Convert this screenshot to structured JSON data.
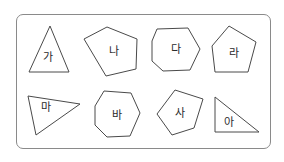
{
  "figure": {
    "frame": {
      "border_color": "#8a8a8a",
      "radius": 7
    },
    "stroke_color": "#4a4a4a",
    "label_color": "#2a2a2a",
    "shapes": [
      {
        "id": "ga",
        "label": "가",
        "type": "triangle",
        "sides": 3,
        "points": "50,26 29,72 69,72",
        "label_pos": [
          48,
          57
        ]
      },
      {
        "id": "na",
        "label": "나",
        "type": "pentagon",
        "sides": 5,
        "points": "84,39 107,27 137,39 136,69 106,76",
        "label_pos": [
          114,
          51
        ]
      },
      {
        "id": "da",
        "label": "다",
        "type": "heptagon",
        "sides": 7,
        "points": "157,29 188,28 200,49 190,70 163,71 152,61 152,41",
        "label_pos": [
          176,
          49
        ]
      },
      {
        "id": "ra",
        "label": "라",
        "type": "pentagon",
        "sides": 5,
        "points": "229,26 256,42 248,72 215,72 212,46",
        "label_pos": [
          234,
          53
        ]
      },
      {
        "id": "ma",
        "label": "마",
        "type": "triangle",
        "sides": 3,
        "points": "28,96 80,104 36,135",
        "label_pos": [
          46,
          107
        ]
      },
      {
        "id": "ba",
        "label": "바",
        "type": "heptagon",
        "sides": 7,
        "points": "104,91 131,93 140,113 130,136 107,137 95,125 95,106",
        "label_pos": [
          117,
          115
        ]
      },
      {
        "id": "sa",
        "label": "사",
        "type": "pentagon",
        "sides": 5,
        "points": "175,90 203,99 194,128 172,135 157,114",
        "label_pos": [
          180,
          113
        ]
      },
      {
        "id": "a",
        "label": "아",
        "type": "right-triangle",
        "sides": 3,
        "points": "215,97 215,132 259,132",
        "label_pos": [
          229,
          122
        ]
      }
    ]
  }
}
